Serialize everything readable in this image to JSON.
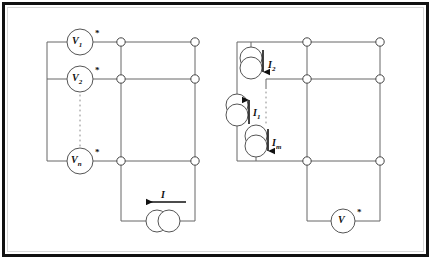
{
  "figure": {
    "background_color": "#ffffff",
    "line_color": "#555555",
    "ink_color": "#111111",
    "border_color": "#111111"
  },
  "left_circuit": {
    "name": "voltage-source-network",
    "sources": [
      {
        "id": "v1",
        "label": "V",
        "subscript": "1",
        "marker": "*",
        "type": "voltage-source",
        "cx": 80,
        "cy": 42,
        "r": 13
      },
      {
        "id": "v2",
        "label": "V",
        "subscript": "2",
        "marker": "*",
        "type": "voltage-source",
        "cx": 80,
        "cy": 79,
        "r": 13
      },
      {
        "id": "vn",
        "label": "V",
        "subscript": "n",
        "marker": "*",
        "type": "voltage-source",
        "cx": 80,
        "cy": 161,
        "r": 13
      }
    ],
    "ellipsis": {
      "from_y": 95,
      "to_y": 147,
      "x": 80,
      "style": "dotted"
    },
    "current_source": {
      "id": "i-source",
      "label": "I",
      "subscript": "",
      "type": "current-source",
      "cx": 163,
      "cy": 221,
      "r": 11,
      "arrow_direction": "left"
    },
    "nodes": [
      {
        "x": 121,
        "y": 42
      },
      {
        "x": 195,
        "y": 42
      },
      {
        "x": 121,
        "y": 79
      },
      {
        "x": 195,
        "y": 79
      },
      {
        "x": 121,
        "y": 161
      },
      {
        "x": 195,
        "y": 161
      }
    ]
  },
  "right_circuit": {
    "name": "current-source-network",
    "sources": [
      {
        "id": "i2",
        "label": "I",
        "subscript": "2",
        "type": "current-source",
        "cx": 251,
        "cy": 63,
        "r": 11,
        "arrow_direction": "down"
      },
      {
        "id": "i1",
        "label": "I",
        "subscript": "1",
        "type": "current-source",
        "cx": 237,
        "cy": 110,
        "r": 11,
        "arrow_direction": "up"
      },
      {
        "id": "im",
        "label": "I",
        "subscript": "m",
        "type": "current-source",
        "cx": 256,
        "cy": 141,
        "r": 11,
        "arrow_direction": "down"
      }
    ],
    "ellipsis": {
      "from_y": 92,
      "to_y": 126,
      "x": 266,
      "style": "dotted"
    },
    "voltmeter": {
      "id": "v-meter",
      "label": "V",
      "marker": "*",
      "type": "voltage-meter",
      "cx": 343,
      "cy": 221,
      "r": 12
    },
    "nodes": [
      {
        "x": 307,
        "y": 42
      },
      {
        "x": 380,
        "y": 42
      },
      {
        "x": 307,
        "y": 79
      },
      {
        "x": 380,
        "y": 79
      },
      {
        "x": 307,
        "y": 161
      },
      {
        "x": 380,
        "y": 161
      }
    ]
  }
}
